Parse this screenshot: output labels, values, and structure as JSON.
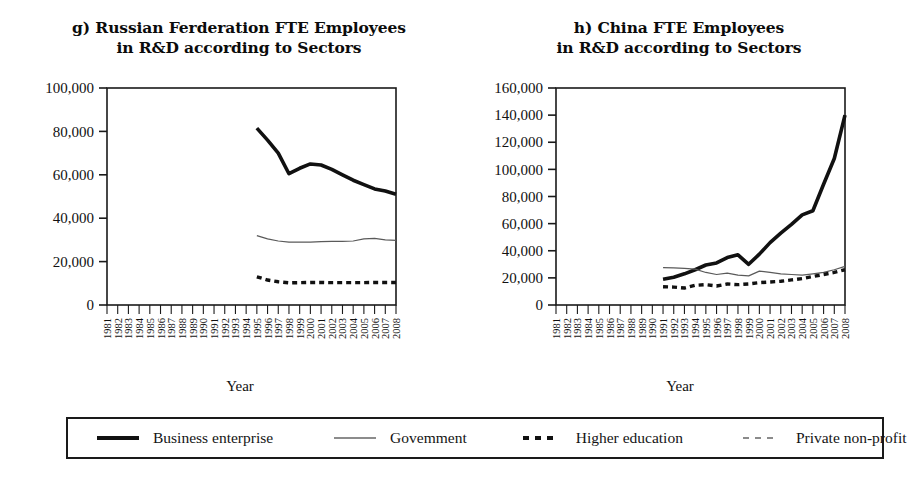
{
  "figure": {
    "background": "#ffffff",
    "line_color": "#111111"
  },
  "panels": [
    {
      "id": "russia",
      "title_line1": "g) Russian Ferderation FTE Employees",
      "title_line2": "in R&D according to Sectors",
      "xlabel": "Year"
    },
    {
      "id": "china",
      "title_line1": "h) China FTE Employees",
      "title_line2": "in R&D according to Sectors",
      "xlabel": "Year"
    }
  ],
  "legend": {
    "items": [
      {
        "label": "Business enterprise",
        "style": "thick-solid"
      },
      {
        "label": "Govemment",
        "style": "thin-solid"
      },
      {
        "label": "Higher education",
        "style": "thick-dashed"
      },
      {
        "label": "Private non-profit",
        "style": "thin-dashed"
      }
    ]
  },
  "chart_data": [
    {
      "type": "line",
      "id": "russia",
      "title": "g) Russian Ferderation FTE Employees in R&D according to Sectors",
      "xlabel": "Year",
      "ylabel": "",
      "ylim": [
        0,
        100000
      ],
      "yticks": [
        0,
        20000,
        40000,
        60000,
        80000,
        100000
      ],
      "ytick_labels": [
        "0",
        "20,000",
        "40,000",
        "60,000",
        "80,000",
        "100,000"
      ],
      "x": [
        1981,
        1982,
        1983,
        1984,
        1985,
        1986,
        1987,
        1988,
        1989,
        1990,
        1991,
        1992,
        1993,
        1994,
        1995,
        1996,
        1997,
        1998,
        1999,
        2000,
        2001,
        2002,
        2003,
        2004,
        2005,
        2006,
        2007,
        2008
      ],
      "xtick_labels": [
        "1981",
        "1982",
        "1983",
        "1984",
        "1985",
        "1986",
        "1987",
        "1988",
        "1989",
        "1990",
        "1991",
        "1992",
        "1993",
        "1994",
        "1995",
        "1996",
        "1997",
        "1998",
        "1999",
        "2000",
        "2001",
        "2002",
        "2003",
        "2004",
        "2005",
        "2006",
        "2007",
        "2008"
      ],
      "grid": false,
      "legend_position": "below-figure",
      "series": [
        {
          "name": "Business enterprise",
          "style": "thick-solid",
          "x": [
            1995,
            1996,
            1997,
            1998,
            1999,
            2000,
            2001,
            2002,
            2003,
            2004,
            2005,
            2006,
            2007,
            2008
          ],
          "values": [
            81500,
            76000,
            70000,
            60500,
            63000,
            65000,
            64500,
            62500,
            60000,
            57500,
            55500,
            53500,
            52500,
            51000
          ]
        },
        {
          "name": "Govemment",
          "style": "thin-solid",
          "x": [
            1995,
            1996,
            1997,
            1998,
            1999,
            2000,
            2001,
            2002,
            2003,
            2004,
            2005,
            2006,
            2007,
            2008
          ],
          "values": [
            32000,
            30500,
            29500,
            29000,
            29000,
            29000,
            29200,
            29300,
            29300,
            29500,
            30500,
            30700,
            30000,
            29800
          ]
        },
        {
          "name": "Higher education",
          "style": "thick-dashed",
          "x": [
            1995,
            1996,
            1997,
            1998,
            1999,
            2000,
            2001,
            2002,
            2003,
            2004,
            2005,
            2006,
            2007,
            2008
          ],
          "values": [
            13000,
            11500,
            10700,
            10200,
            10300,
            10400,
            10400,
            10300,
            10300,
            10300,
            10300,
            10400,
            10400,
            10400
          ]
        }
      ]
    },
    {
      "type": "line",
      "id": "china",
      "title": "h) China FTE Employees in R&D according to Sectors",
      "xlabel": "Year",
      "ylabel": "",
      "ylim": [
        0,
        160000
      ],
      "yticks": [
        0,
        20000,
        40000,
        60000,
        80000,
        100000,
        120000,
        140000,
        160000
      ],
      "ytick_labels": [
        "0",
        "20,000",
        "40,000",
        "60,000",
        "80,000",
        "100,000",
        "120,000",
        "140,000",
        "160,000"
      ],
      "x": [
        1981,
        1982,
        1983,
        1984,
        1985,
        1986,
        1987,
        1988,
        1989,
        1990,
        1991,
        1992,
        1993,
        1994,
        1995,
        1996,
        1997,
        1998,
        1999,
        2000,
        2001,
        2002,
        2003,
        2004,
        2005,
        2006,
        2007,
        2008
      ],
      "xtick_labels": [
        "1981",
        "1982",
        "1983",
        "1984",
        "1985",
        "1986",
        "1987",
        "1988",
        "1989",
        "1990",
        "1991",
        "1992",
        "1993",
        "1994",
        "1995",
        "1996",
        "1997",
        "1998",
        "1999",
        "2000",
        "2001",
        "2002",
        "2003",
        "2004",
        "2005",
        "2006",
        "2007",
        "2008"
      ],
      "grid": false,
      "legend_position": "below-figure",
      "series": [
        {
          "name": "Business enterprise",
          "style": "thick-solid",
          "x": [
            1991,
            1992,
            1993,
            1994,
            1995,
            1996,
            1997,
            1998,
            1999,
            2000,
            2001,
            2002,
            2003,
            2004,
            2005,
            2006,
            2007,
            2008
          ],
          "values": [
            19000,
            20500,
            23000,
            26000,
            29500,
            31000,
            35000,
            37000,
            30000,
            37500,
            46000,
            53000,
            59500,
            66500,
            69500,
            89000,
            108000,
            140000
          ]
        },
        {
          "name": "Govemment",
          "style": "thin-solid",
          "x": [
            1991,
            1992,
            1993,
            1994,
            1995,
            1996,
            1997,
            1998,
            1999,
            2000,
            2001,
            2002,
            2003,
            2004,
            2005,
            2006,
            2007,
            2008
          ],
          "values": [
            27500,
            27300,
            27000,
            26500,
            24000,
            22500,
            23500,
            22000,
            21500,
            25000,
            24000,
            23000,
            22500,
            22000,
            23000,
            24000,
            26000,
            28500
          ]
        },
        {
          "name": "Higher education",
          "style": "thick-dashed",
          "x": [
            1991,
            1992,
            1993,
            1994,
            1995,
            1996,
            1997,
            1998,
            1999,
            2000,
            2001,
            2002,
            2003,
            2004,
            2005,
            2006,
            2007,
            2008
          ],
          "values": [
            13500,
            13200,
            12500,
            14500,
            15000,
            14000,
            15500,
            15000,
            15500,
            16500,
            17000,
            17500,
            18500,
            19500,
            21000,
            22500,
            24000,
            26000
          ]
        }
      ]
    }
  ]
}
